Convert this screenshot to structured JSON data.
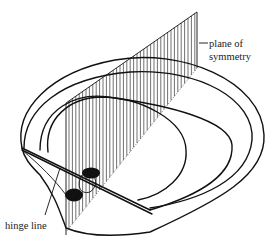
{
  "figure": {
    "type": "diagram",
    "labels": {
      "plane": "plane of symmetry",
      "plane_line1": "plane of",
      "plane_line2": "symmetry",
      "hinge": "hinge line"
    },
    "colors": {
      "ink": "#111111",
      "background": "#ffffff"
    }
  }
}
